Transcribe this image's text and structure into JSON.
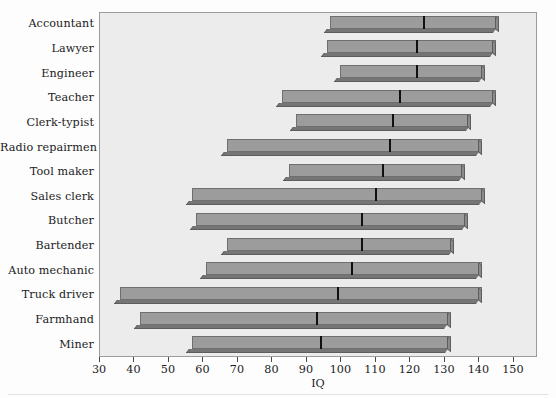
{
  "chart_data": {
    "type": "bar",
    "chart_style": "range-bar-with-median",
    "title": "",
    "xlabel": "IQ",
    "ylabel": "",
    "xlim": [
      30,
      157
    ],
    "xticks": [
      30,
      40,
      50,
      60,
      70,
      80,
      90,
      100,
      110,
      120,
      130,
      140,
      150
    ],
    "xtick_labels": [
      "30",
      "40",
      "50",
      "60",
      "70",
      "80",
      "90",
      "100",
      "110",
      "120",
      "130",
      "140",
      "150"
    ],
    "grid": false,
    "legend": "none",
    "categories": [
      "Accountant",
      "Lawyer",
      "Engineer",
      "Teacher",
      "Clerk-typist",
      "Radio repairmen",
      "Tool maker",
      "Sales clerk",
      "Butcher",
      "Bartender",
      "Auto mechanic",
      "Truck driver",
      "Farmhand",
      "Miner"
    ],
    "series": [
      {
        "name": "IQ range (low – high) with median",
        "low": [
          97,
          96,
          100,
          83,
          87,
          67,
          85,
          57,
          58,
          67,
          61,
          36,
          42,
          57
        ],
        "high": [
          146,
          145,
          142,
          145,
          138,
          141,
          136,
          142,
          137,
          133,
          141,
          141,
          132,
          132
        ],
        "median": [
          124,
          122,
          122,
          117,
          115,
          114,
          112,
          110,
          106,
          106,
          103,
          99,
          93,
          94
        ]
      }
    ],
    "colors": {
      "bar_face": "#9c9c9c",
      "bar_shadow": "#757575",
      "bar_outline": "#6f6f6f",
      "median_marker": "#101010",
      "plot_background": "#ececec",
      "plot_border": "#9b9b9b",
      "page_background": "#fdfdfd",
      "text": "#1b1b1b"
    }
  }
}
